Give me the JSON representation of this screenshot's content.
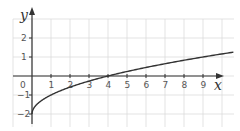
{
  "chart_data": {
    "type": "line",
    "title": "",
    "xlabel": "x",
    "ylabel": "y",
    "function": "y = sqrt(x) - 2",
    "xlim": [
      -1,
      10.6
    ],
    "ylim": [
      -2.6,
      3
    ],
    "grid": true,
    "x_ticks": [
      "1",
      "2",
      "3",
      "4",
      "5",
      "6",
      "7",
      "8",
      "9"
    ],
    "y_ticks": [
      "2",
      "1",
      "-1",
      "-2"
    ],
    "origin_label": "0",
    "series": [
      {
        "name": "y = √x − 2",
        "x": [
          0,
          0.25,
          1,
          2,
          3,
          4,
          5,
          6,
          7,
          8,
          9,
          10,
          10.6
        ],
        "values": [
          -2,
          -1.5,
          -1,
          -0.59,
          -0.27,
          0,
          0.24,
          0.45,
          0.65,
          0.83,
          1,
          1.16,
          1.26
        ]
      }
    ],
    "colors": {
      "curve": "#333333",
      "axis": "#333333",
      "grid": "#dcdcdc"
    }
  }
}
